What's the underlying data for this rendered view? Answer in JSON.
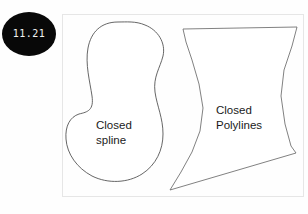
{
  "figure": {
    "name": "closed-spline-and-closed-polylines-diagram",
    "background_color": "#fefefe",
    "frame": {
      "stroke_color": "#e2e2e2",
      "x": 62,
      "y": 14,
      "width": 242,
      "height": 183
    }
  },
  "badge": {
    "label": "11.21",
    "background_color": "#080808",
    "text_color": "#f2f2f2"
  },
  "shapes": [
    {
      "id": "closed-spline",
      "kind": "closed-spline",
      "label": "Closed\nspline",
      "stroke_color": "#4a4a4a",
      "fill_color": "#ffffff",
      "stroke_width": 0.8
    },
    {
      "id": "closed-polylines",
      "kind": "closed-polylines",
      "label": "Closed\nPolylines",
      "stroke_color": "#6a6a6a",
      "fill_color": "#ffffff",
      "stroke_width": 0.8
    }
  ],
  "labels": {
    "spline": "Closed\nspline",
    "polyline": "Closed\nPolylines"
  }
}
